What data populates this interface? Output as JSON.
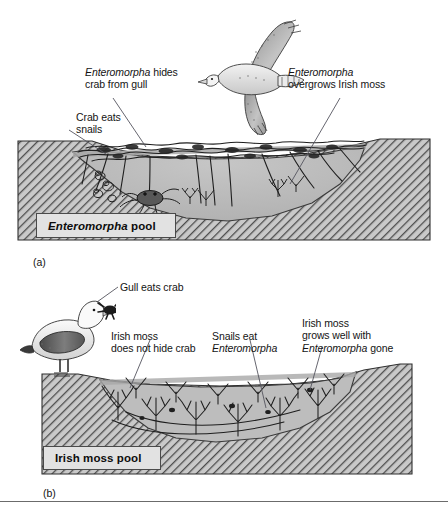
{
  "figure": {
    "divider": "horizontal-rule"
  },
  "panel_a": {
    "marker": "(a)",
    "pool_label_italic": "Enteromorpha",
    "pool_label_rest": " pool",
    "organisms": {
      "gull": "flying-gull",
      "crab": "crab",
      "snails": "snails",
      "algae": "enteromorpha-canopy",
      "irish_moss": "irish-moss-tuft"
    },
    "labels": [
      {
        "name": "enteromorpha-hides-crab",
        "line1_italic": "Enteromorpha",
        "line1_rest": " hides",
        "line2": "crab from gull"
      },
      {
        "name": "crab-eats-snails",
        "line1": "Crab eats",
        "line2": "snails"
      },
      {
        "name": "enteromorpha-overgrows-irish-moss",
        "line1_italic": "Enteromorpha",
        "line2": "overgrows Irish moss"
      }
    ]
  },
  "panel_b": {
    "marker": "(b)",
    "pool_label": "Irish moss pool",
    "organisms": {
      "gull": "standing-gull",
      "crab": "crab-in-beak",
      "irish_moss": "irish-moss-bed"
    },
    "labels": [
      {
        "name": "gull-eats-crab",
        "line1": "Gull eats crab"
      },
      {
        "name": "irish-moss-does-not-hide-crab",
        "line1": "Irish moss",
        "line2": "does not hide crab"
      },
      {
        "name": "snails-eat-enteromorpha",
        "line1": "Snails eat",
        "line2_italic": "Enteromorpha"
      },
      {
        "name": "irish-moss-grows-well",
        "line1": "Irish moss",
        "line2": "grows well with",
        "line3_italic": "Enteromorpha",
        "line3_rest": " gone"
      }
    ]
  },
  "colors": {
    "rock_fill": "#c9c9c9",
    "rock_hatch": "#4d4d4d",
    "water_fill": "#bdbdbd",
    "water_surface": "#a8a8a8",
    "box_fill": "#e2e2e2",
    "box_border": "#4a4a4a",
    "ink": "#141414",
    "leader": "#55555f"
  }
}
